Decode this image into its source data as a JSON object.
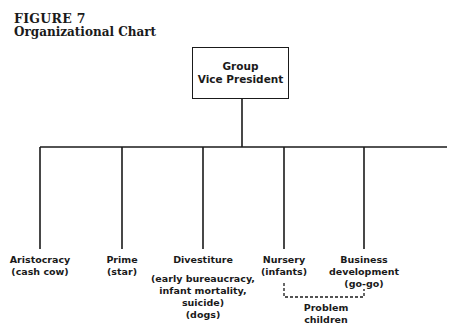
{
  "figure": {
    "number": "FIGURE 7",
    "title": "Organizational Chart"
  },
  "root": {
    "line1": "Group",
    "line2": "Vice President"
  },
  "children": [
    {
      "name": "Aristocracy",
      "alias": "(cash cow)"
    },
    {
      "name": "Prime",
      "alias": "(star)"
    },
    {
      "name": "Divestiture",
      "note_lines": [
        "(early bureaucracy,",
        "infant mortality,",
        "suicide)",
        "(dogs)"
      ]
    },
    {
      "name": "Nursery",
      "alias": "(infants)"
    },
    {
      "name": "Business",
      "name_line2": "development",
      "alias": "(go-go)"
    }
  ],
  "dashed_link": {
    "from": "Nursery",
    "to": "Business development",
    "label_line1": "Problem",
    "label_line2": "children"
  }
}
